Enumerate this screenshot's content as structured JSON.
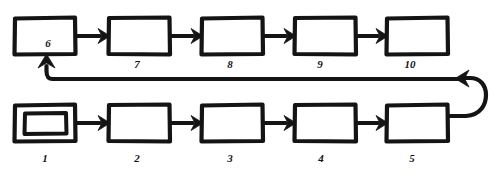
{
  "diagram": {
    "kind": "hand-drawn-flowchart",
    "title": "",
    "stroke_color": "#141414",
    "fill_color": "#ffffff",
    "background_color": "#ffffff",
    "rows": [
      {
        "row_name": "top-row",
        "flow_direction": "left-to-right",
        "nodes": [
          {
            "id": "node-6",
            "label": "6",
            "shape": "rectangle",
            "x": 14,
            "y": 17,
            "w": 62,
            "h": 38,
            "label_x": 48,
            "label_y": 47,
            "label_position": "inside-bottom"
          },
          {
            "id": "node-7",
            "label": "7",
            "shape": "rectangle",
            "x": 108,
            "y": 17,
            "w": 62,
            "h": 38,
            "label_x": 137,
            "label_y": 68,
            "label_position": "below"
          },
          {
            "id": "node-8",
            "label": "8",
            "shape": "rectangle",
            "x": 201,
            "y": 17,
            "w": 62,
            "h": 38,
            "label_x": 230,
            "label_y": 68,
            "label_position": "below"
          },
          {
            "id": "node-9",
            "label": "9",
            "shape": "rectangle",
            "x": 294,
            "y": 17,
            "w": 62,
            "h": 38,
            "label_x": 320,
            "label_y": 68,
            "label_position": "below"
          },
          {
            "id": "node-10",
            "label": "10",
            "shape": "rectangle",
            "x": 386,
            "y": 17,
            "w": 62,
            "h": 38,
            "label_x": 410,
            "label_y": 68,
            "label_position": "below"
          }
        ]
      },
      {
        "row_name": "bottom-row",
        "flow_direction": "left-to-right",
        "nodes": [
          {
            "id": "node-1",
            "label": "1",
            "shape": "double-rectangle",
            "x": 14,
            "y": 104,
            "w": 62,
            "h": 38,
            "label_x": 45,
            "label_y": 162,
            "label_position": "below"
          },
          {
            "id": "node-2",
            "label": "2",
            "shape": "rectangle",
            "x": 108,
            "y": 104,
            "w": 62,
            "h": 38,
            "label_x": 137,
            "label_y": 162,
            "label_position": "below"
          },
          {
            "id": "node-3",
            "label": "3",
            "shape": "rectangle",
            "x": 201,
            "y": 104,
            "w": 62,
            "h": 38,
            "label_x": 230,
            "label_y": 162,
            "label_position": "below"
          },
          {
            "id": "node-4",
            "label": "4",
            "shape": "rectangle",
            "x": 294,
            "y": 104,
            "w": 62,
            "h": 38,
            "label_x": 321,
            "label_y": 162,
            "label_position": "below"
          },
          {
            "id": "node-5",
            "label": "5",
            "shape": "rectangle",
            "x": 386,
            "y": 104,
            "w": 62,
            "h": 38,
            "label_x": 412,
            "label_y": 162,
            "label_position": "below"
          }
        ]
      }
    ],
    "connectors": [
      {
        "id": "edge-6-7",
        "from": "node-6",
        "to": "node-7",
        "type": "straight-arrow",
        "direction": "right"
      },
      {
        "id": "edge-7-8",
        "from": "node-7",
        "to": "node-8",
        "type": "straight-arrow",
        "direction": "right"
      },
      {
        "id": "edge-8-9",
        "from": "node-8",
        "to": "node-9",
        "type": "straight-arrow",
        "direction": "right"
      },
      {
        "id": "edge-9-10",
        "from": "node-9",
        "to": "node-10",
        "type": "straight-arrow",
        "direction": "right"
      },
      {
        "id": "edge-1-2",
        "from": "node-1",
        "to": "node-2",
        "type": "straight-arrow",
        "direction": "right"
      },
      {
        "id": "edge-2-3",
        "from": "node-2",
        "to": "node-3",
        "type": "straight-arrow",
        "direction": "right"
      },
      {
        "id": "edge-3-4",
        "from": "node-3",
        "to": "node-4",
        "type": "straight-arrow",
        "direction": "right"
      },
      {
        "id": "edge-4-5",
        "from": "node-4",
        "to": "node-5",
        "type": "straight-arrow",
        "direction": "right"
      },
      {
        "id": "edge-5-loop",
        "from": "node-5",
        "to": "feedback-line",
        "type": "curved-loop",
        "direction": "right-then-up-then-left"
      },
      {
        "id": "edge-loop-6",
        "from": "feedback-line",
        "to": "node-6",
        "type": "long-horizontal-then-up-arrow",
        "direction": "left-then-up"
      }
    ]
  }
}
